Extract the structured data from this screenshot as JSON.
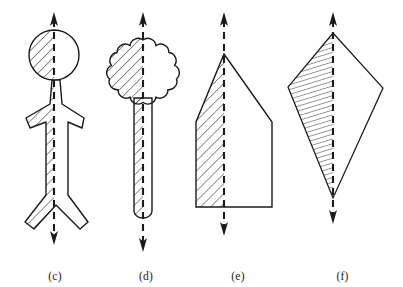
{
  "figure": {
    "background_color": "#ffffff",
    "ink_color": "#1a1a1a",
    "hatch_color": "#333333",
    "width": 403,
    "height": 287
  },
  "panels": [
    {
      "id": "c",
      "caption": "(c)",
      "shape_name": "stick-figure",
      "description": "Human stick figure outline with round head, arms and legs",
      "axis": {
        "type": "dashed-double-arrow-vertical",
        "x": 54,
        "y_top": 14,
        "y_bottom": 243,
        "arrow_top": true,
        "arrow_bottom": true,
        "dash": "7 5"
      },
      "hatched_half": "left",
      "hatch_angle_deg": 45,
      "hatch_spacing_px": 5
    },
    {
      "id": "d",
      "caption": "(d)",
      "shape_name": "mace-with-scalloped-head",
      "description": "Ten lobed scalloped flower head on a narrow straight handle",
      "axis": {
        "type": "dashed-double-arrow-vertical",
        "x": 143,
        "y_top": 14,
        "y_bottom": 250,
        "arrow_top": true,
        "arrow_bottom": true,
        "dash": "7 5"
      },
      "hatched_half": "left",
      "hatch_angle_deg": 45,
      "hatch_spacing_px": 5,
      "lobes": 10
    },
    {
      "id": "e",
      "caption": "(e)",
      "shape_name": "pentagon-house-point-up",
      "description": "House shaped pentagon with apex at top and flat base",
      "axis": {
        "type": "dashed-double-arrow-vertical",
        "x": 224,
        "y_top": 14,
        "y_bottom": 234,
        "arrow_top": true,
        "arrow_bottom": true,
        "dash": "7 5"
      },
      "hatched_half": "left",
      "hatch_angle_deg": 45,
      "hatch_spacing_px": 5
    },
    {
      "id": "f",
      "caption": "(f)",
      "shape_name": "kite-quadrilateral",
      "description": "Tall kite shaped quadrilateral, top apex, two side points, bottom point",
      "axis": {
        "type": "dashed-double-arrow-vertical",
        "x": 333,
        "y_top": 14,
        "y_bottom": 222,
        "arrow_top": true,
        "arrow_bottom": true,
        "dash": "7 5"
      },
      "hatched_half": "left",
      "hatch_angle_deg": 75,
      "hatch_spacing_px": 4
    }
  ]
}
